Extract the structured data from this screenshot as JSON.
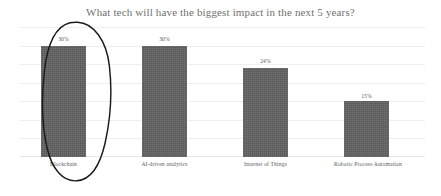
{
  "chart_data": {
    "type": "bar",
    "title": "What tech will have the biggest impact in the next 5 years?",
    "xlabel": "",
    "ylabel": "",
    "categories": [
      "Blockchain",
      "AI-driven analytics",
      "Internet of Things",
      "Robotic Process Automation"
    ],
    "values": [
      30,
      30,
      24,
      15
    ],
    "value_labels": [
      "30%",
      "30%",
      "24%",
      "15%"
    ],
    "ylim": [
      0,
      35
    ],
    "grid": true,
    "gridlines": [
      0,
      5,
      10,
      15,
      20,
      25,
      30,
      35
    ],
    "legend": null,
    "series": [
      {
        "name": "Share of respondents",
        "values": [
          30,
          30,
          24,
          15
        ]
      }
    ],
    "annotations": [
      {
        "type": "ellipse",
        "target": "Blockchain",
        "style": "hand-drawn-circle",
        "color": "#1a1a1a"
      }
    ],
    "colors": {
      "bar": "#606060",
      "gridline": "#eceef1",
      "title_text": "#6f6f6f",
      "label_text": "#5a5a5a",
      "background": "#ffffff",
      "annotation": "#1a1a1a"
    }
  }
}
